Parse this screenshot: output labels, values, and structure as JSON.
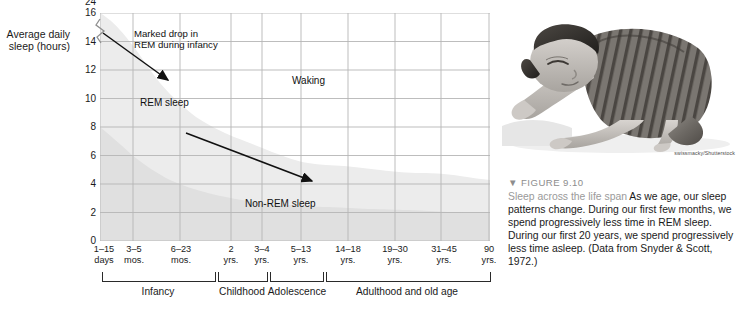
{
  "chart_data": {
    "type": "area",
    "title": "Sleep across the life span",
    "ylabel": "Average daily sleep (hours)",
    "xlabel": "",
    "ylim": [
      0,
      16
    ],
    "y_break_top": 24,
    "yticks": [
      0,
      2,
      4,
      6,
      8,
      10,
      12,
      14,
      16,
      24
    ],
    "grid": true,
    "legend": "inline-annotations",
    "categories": [
      "1–15\ndays",
      "3–5\nmos.",
      "6–23\nmos.",
      "2\nyrs.",
      "3–4\nyrs.",
      "5–13\nyrs.",
      "14–18\nyrs.",
      "19–30\nyrs.",
      "31–45\nyrs.",
      "90\nyrs."
    ],
    "category_positions_pct": [
      0,
      8.5,
      20.5,
      33.5,
      41.5,
      51.5,
      63.5,
      75.5,
      87.5,
      100
    ],
    "series": [
      {
        "name": "REM sleep",
        "values": [
          8,
          6.5,
          4.5,
          3.2,
          2.6,
          2.2,
          2.0,
          1.9,
          1.8,
          1.5
        ]
      },
      {
        "name": "Non-REM sleep",
        "values": [
          8,
          7.5,
          7.0,
          6.8,
          6.6,
          6.3,
          6.1,
          5.6,
          4.9,
          4.2
        ]
      }
    ],
    "total_sleep": [
      16,
      14,
      11.5,
      10,
      9.2,
      8.5,
      8.1,
      7.5,
      6.7,
      5.7
    ],
    "region_labels": [
      "Waking",
      "REM sleep",
      "Non-REM sleep"
    ],
    "annotations": [
      {
        "text": "Marked drop in\nREM during infancy"
      }
    ],
    "stages": [
      "Infancy",
      "Childhood",
      "Adolescence",
      "Adulthood and old age"
    ],
    "source": "Data from Snyder & Scott, 1972."
  },
  "axis": {
    "y_title": "Average\ndaily sleep\n(hours)",
    "y_ticks": [
      "24",
      "16",
      "14",
      "12",
      "10",
      "8",
      "6",
      "4",
      "2",
      "0"
    ],
    "x_ticks": [
      "1–15\ndays",
      "3–5\nmos.",
      "6–23\nmos.",
      "2\nyrs.",
      "3–4\nyrs.",
      "5–13\nyrs.",
      "14–18\nyrs.",
      "19–30\nyrs.",
      "31–45\nyrs.",
      "90\nyrs."
    ]
  },
  "plot_notes": {
    "annotation_drop": "Marked drop in\nREM during infancy",
    "label_rem": "REM sleep",
    "label_waking": "Waking",
    "label_nonrem": "Non-REM sleep"
  },
  "stages": [
    {
      "label": "Infancy"
    },
    {
      "label": "Childhood"
    },
    {
      "label": "Adolescence"
    },
    {
      "label": "Adulthood and old age"
    }
  ],
  "photo": {
    "alt": "sleeping-child-photo",
    "credit": "swissmacky/Shutterstock"
  },
  "caption": {
    "kicker": "▼ FIGURE 9.10",
    "lead": "Sleep across the life span",
    "body": "  As we age, our sleep patterns change. During our first few months, we spend progressively less time in REM sleep. During our first 20 years, we spend progressively less time asleep. (Data from Snyder & Scott, 1972.)"
  },
  "colors": {
    "rem_band": "#e2e2e2",
    "nonrem_band": "#efefef",
    "grid": "#b9b9b9",
    "axis": "#8e8e8e",
    "text": "#1a1a1a",
    "kicker": "#8d8d8d"
  }
}
